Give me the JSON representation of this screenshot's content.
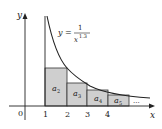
{
  "diagram": {
    "function_label": {
      "lhs": "y =",
      "numerator": "1",
      "denominator_base": "x",
      "denominator_exp": "1.3"
    },
    "axes": {
      "x_label": "x",
      "y_label": "y",
      "origin_label": "0"
    },
    "x_ticks": [
      "1",
      "2",
      "3",
      "4"
    ],
    "rectangles": [
      {
        "label": "a",
        "sub": "2"
      },
      {
        "label": "a",
        "sub": "3"
      },
      {
        "label": "a",
        "sub": "4"
      },
      {
        "label": "a",
        "sub": "5"
      }
    ],
    "ellipsis": "...",
    "colors": {
      "rect_fill": "#cfcfcf",
      "stroke": "#222222"
    }
  }
}
